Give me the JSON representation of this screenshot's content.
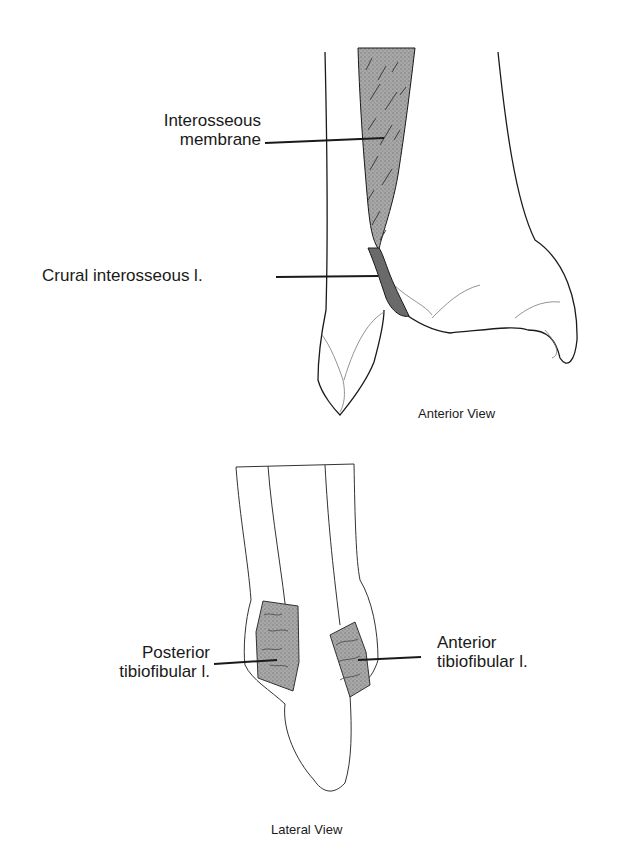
{
  "anterior": {
    "caption": "Anterior View",
    "labels": {
      "interosseous_membrane": [
        "Interosseous",
        "membrane"
      ],
      "crural_interosseous": "Crural interosseous l."
    }
  },
  "lateral": {
    "caption": "Lateral View",
    "labels": {
      "posterior_tibiofibular": [
        "Posterior",
        "tibiofibular l."
      ],
      "anterior_tibiofibular": [
        "Anterior",
        "tibiofibular l."
      ]
    }
  },
  "colors": {
    "line": "#1a1a1a",
    "ligament_fill": "#9a9a9a",
    "background": "#ffffff"
  }
}
